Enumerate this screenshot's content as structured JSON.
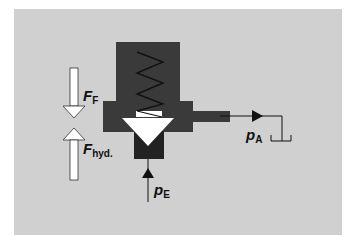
{
  "diagram": {
    "labels": {
      "spring_force": {
        "main": "F",
        "sub": "F"
      },
      "hydraulic_force": {
        "main": "F",
        "sub": "hyd."
      },
      "outlet_pressure": {
        "main": "p",
        "sub": "A"
      },
      "inlet_pressure": {
        "main": "p",
        "sub": "E"
      }
    },
    "colors": {
      "background": "#d0d0d0",
      "valve_body": "#3a3a3a",
      "poppet": "#ffffff",
      "lines": "#111111"
    },
    "components": [
      "valve-body",
      "spring",
      "poppet-cone",
      "spring-seat",
      "outlet-port",
      "inlet-port",
      "tank",
      "force-arrow-down",
      "force-arrow-up"
    ]
  }
}
